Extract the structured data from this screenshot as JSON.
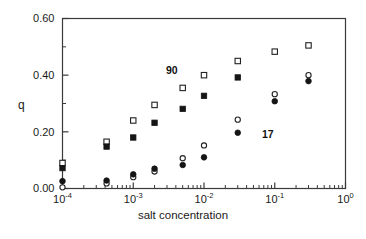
{
  "chart_data": {
    "type": "scatter",
    "title": "",
    "xlabel": "salt concentration",
    "ylabel": "q",
    "xscale": "log",
    "yscale": "linear",
    "xlim": [
      0.0001,
      1.0
    ],
    "ylim": [
      0.0,
      0.6
    ],
    "grid": false,
    "legend": "none",
    "xticks": [
      0.0001,
      0.001,
      0.01,
      0.1,
      1.0
    ],
    "xtick_labels": [
      "10-4",
      "10-3",
      "10-2",
      "10-1",
      "100"
    ],
    "xtick_mantissa": [
      "10",
      "10",
      "10",
      "10",
      "10"
    ],
    "xtick_exponent": [
      "-4",
      "-3",
      "-2",
      "-1",
      "0"
    ],
    "yticks": [
      0.0,
      0.2,
      0.4,
      0.6
    ],
    "ytick_labels": [
      "0.00",
      "0.20",
      "0.40",
      "0.60"
    ],
    "yticks_minor": [
      0.1,
      0.3,
      0.5
    ],
    "annotations": [
      {
        "text": "90",
        "x": 0.0045,
        "y": 0.425
      },
      {
        "text": "17",
        "x": 0.12,
        "y": 0.155
      }
    ],
    "series": [
      {
        "name": "open-square",
        "marker": "open-square",
        "points": [
          {
            "x": 0.0001,
            "y": 0.09
          },
          {
            "x": 0.00042,
            "y": 0.165
          },
          {
            "x": 0.001,
            "y": 0.24
          },
          {
            "x": 0.002,
            "y": 0.295
          },
          {
            "x": 0.005,
            "y": 0.355
          },
          {
            "x": 0.01,
            "y": 0.4
          },
          {
            "x": 0.03,
            "y": 0.45
          },
          {
            "x": 0.1,
            "y": 0.483
          },
          {
            "x": 0.3,
            "y": 0.505
          }
        ]
      },
      {
        "name": "filled-square",
        "marker": "filled-square",
        "points": [
          {
            "x": 0.0001,
            "y": 0.072
          },
          {
            "x": 0.00042,
            "y": 0.148
          },
          {
            "x": 0.001,
            "y": 0.18
          },
          {
            "x": 0.002,
            "y": 0.232
          },
          {
            "x": 0.005,
            "y": 0.281
          },
          {
            "x": 0.01,
            "y": 0.327
          },
          {
            "x": 0.03,
            "y": 0.392
          }
        ]
      },
      {
        "name": "open-circle",
        "marker": "open-circle",
        "points": [
          {
            "x": 0.0001,
            "y": 0.004
          },
          {
            "x": 0.00042,
            "y": 0.018
          },
          {
            "x": 0.001,
            "y": 0.04
          },
          {
            "x": 0.002,
            "y": 0.06
          },
          {
            "x": 0.005,
            "y": 0.107
          },
          {
            "x": 0.01,
            "y": 0.152
          },
          {
            "x": 0.03,
            "y": 0.243
          },
          {
            "x": 0.1,
            "y": 0.333
          },
          {
            "x": 0.3,
            "y": 0.4
          }
        ]
      },
      {
        "name": "filled-circle",
        "marker": "filled-circle",
        "points": [
          {
            "x": 0.0001,
            "y": 0.026
          },
          {
            "x": 0.00042,
            "y": 0.028
          },
          {
            "x": 0.001,
            "y": 0.05
          },
          {
            "x": 0.002,
            "y": 0.07
          },
          {
            "x": 0.005,
            "y": 0.083
          },
          {
            "x": 0.01,
            "y": 0.11
          },
          {
            "x": 0.03,
            "y": 0.197
          },
          {
            "x": 0.1,
            "y": 0.308
          },
          {
            "x": 0.3,
            "y": 0.379
          }
        ]
      }
    ]
  }
}
